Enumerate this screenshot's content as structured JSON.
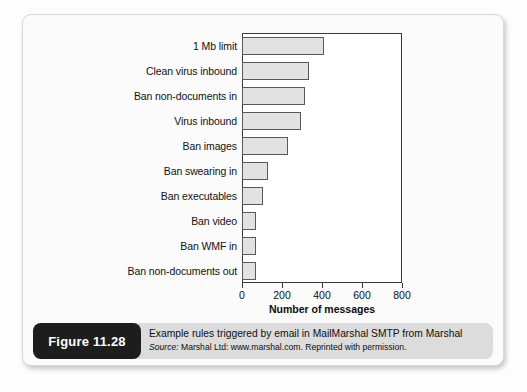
{
  "figure": {
    "tag": "Figure 11.28",
    "caption_title": "Example rules triggered by email in MailMarshal SMTP from Marshal",
    "source_prefix": "Source:",
    "source_rest": " Marshal Ltd: www.marshal.com. Reprinted with permission."
  },
  "colors": {
    "bar_fill": "#e2e2e2",
    "bar_stroke": "#585858",
    "axis": "#3a3a3a",
    "caption_bg": "#dcdcdc",
    "tag_bg": "#1d1d1d",
    "panel_bg": "#fbfbfb"
  },
  "chart_data": {
    "type": "bar",
    "orientation": "horizontal",
    "title": "",
    "xlabel": "Number of messages",
    "ylabel": "",
    "xlim": [
      0,
      800
    ],
    "xticks": [
      0,
      200,
      400,
      600,
      800
    ],
    "xtick_labels": [
      "0",
      "200",
      "400",
      "600",
      "800"
    ],
    "grid": false,
    "legend": false,
    "categories": [
      "1 Mb limit",
      "Clean virus inbound",
      "Ban non-documents in",
      "Virus inbound",
      "Ban images",
      "Ban swearing in",
      "Ban executables",
      "Ban video",
      "Ban WMF in",
      "Ban non-documents out"
    ],
    "values": [
      410,
      335,
      315,
      295,
      230,
      130,
      105,
      70,
      70,
      70
    ],
    "series": [
      {
        "name": "Number of messages",
        "values": [
          410,
          335,
          315,
          295,
          230,
          130,
          105,
          70,
          70,
          70
        ]
      }
    ]
  }
}
